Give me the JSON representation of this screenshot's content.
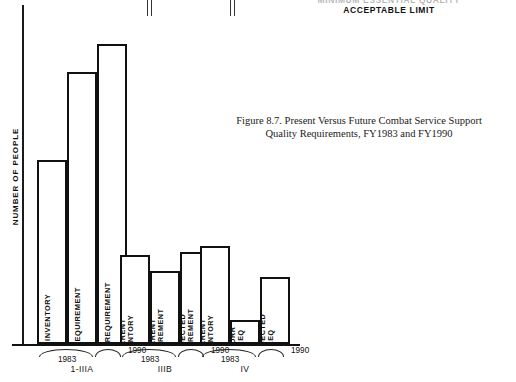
{
  "annotation": {
    "line1_clipped": "MINIMUM ESSENTIAL QUALITY",
    "line2": "ACCEPTABLE LIMIT"
  },
  "caption": {
    "line1": "Figure 8.7.  Present Versus Future Combat Service Support",
    "line2": "Quality Requirements, FY1983 and FY1990"
  },
  "axes": {
    "ylabel": "NUMBER OF PEOPLE",
    "xlabel": ""
  },
  "chart_data": {
    "type": "bar",
    "title": "Figure 8.7.  Present Versus Future Combat Service Support Quality Requirements, FY1983 and FY1990",
    "xlabel": "",
    "ylabel": "NUMBER OF PEOPLE",
    "ylim": [
      0,
      100
    ],
    "grid": false,
    "legend": false,
    "annotations": [
      "MINIMUM ESSENTIAL QUALITY",
      "ACCEPTABLE LIMIT"
    ],
    "groups": [
      {
        "name": "1-IIIA",
        "years": [
          "1983",
          "1990"
        ],
        "bars": [
          {
            "label": "CURRENT INVENTORY",
            "label_l1": "CURRENT INVENTORY",
            "label_l2": "",
            "year": "1983",
            "value": 60
          },
          {
            "label": "CURRENT REQUIREMENT",
            "label_l1": "CURRENT REQUIREMENT",
            "label_l2": "",
            "year": "1983",
            "value": 89
          },
          {
            "label": "PROJECTED REQUIREMENT",
            "label_l1": "PROJECTED REQUIREMENT",
            "label_l2": "",
            "year": "1990",
            "value": 98
          }
        ]
      },
      {
        "name": "IIIB",
        "years": [
          "1983",
          "1990"
        ],
        "bars": [
          {
            "label": "CURRENT INVENTORY",
            "label_l1": "CURRENT",
            "label_l2": "INVENTORY",
            "year": "1983",
            "value": 29
          },
          {
            "label": "CURRENT REQUIREMENT",
            "label_l1": "CURRENT",
            "label_l2": "REQUIREMENT",
            "year": "1983",
            "value": 24
          },
          {
            "label": "PROJECTED REQUIREMENT",
            "label_l1": "PROJECTED",
            "label_l2": "REQUIREMENT",
            "year": "1990",
            "value": 30
          }
        ]
      },
      {
        "name": "IV",
        "years": [
          "1983",
          "1990"
        ],
        "bars": [
          {
            "label": "CURRENT INVENTORY",
            "label_l1": "CURRENT",
            "label_l2": "INVENTORY",
            "year": "1983",
            "value": 32
          },
          {
            "label": "CURR. REQ",
            "label_l1": "CURR",
            "label_l2": "REQ",
            "year": "1983",
            "value": 8
          },
          {
            "label": "PROJECTED REQ",
            "label_l1": "PROJECTED",
            "label_l2": "REQ",
            "year": "1990",
            "value": 22
          }
        ]
      }
    ]
  }
}
